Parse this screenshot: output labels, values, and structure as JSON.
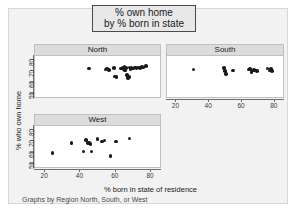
{
  "title": {
    "line1": "% own home",
    "line2": "by % born in state"
  },
  "axis": {
    "ylabel": "% who own home",
    "xlabel": "% born in state of residence",
    "note": "Graphs by Region North, South, or West",
    "yticks": [
      "80",
      "70",
      "60",
      "50"
    ],
    "xticks": [
      "20",
      "40",
      "60",
      "80"
    ]
  },
  "panels": {
    "north_label": "North",
    "south_label": "South",
    "west_label": "West"
  },
  "colors": {
    "marker": "#1a1a1a",
    "panel_header": "#dcdcdc",
    "plot_background": "#ffffff",
    "graph_background": "#f2f2f2",
    "title_box_background": "#e8e8e8",
    "axis": "#6e6e6e"
  },
  "chart_data": {
    "type": "scatter",
    "title": "% own home by % born in state",
    "xlabel": "% born in state of residence",
    "ylabel": "% who own home",
    "note": "Graphs by Region North, South, or West",
    "xlim": [
      14,
      86
    ],
    "ylim": [
      46,
      84
    ],
    "xticks": [
      20,
      40,
      60,
      80
    ],
    "yticks": [
      50,
      60,
      70,
      80
    ],
    "grid": false,
    "legend": "none",
    "facet_by": "Region",
    "series": [
      {
        "name": "North",
        "points": [
          [
            45.0,
            72.5
          ],
          [
            54.5,
            71.5
          ],
          [
            55.5,
            72.5
          ],
          [
            56.5,
            71.0
          ],
          [
            59.5,
            73.0
          ],
          [
            60.0,
            65.0
          ],
          [
            61.0,
            64.5
          ],
          [
            63.5,
            72.5
          ],
          [
            64.5,
            73.5
          ],
          [
            65.0,
            72.0
          ],
          [
            65.5,
            74.0
          ],
          [
            66.0,
            70.5
          ],
          [
            66.5,
            73.0
          ],
          [
            67.0,
            66.5
          ],
          [
            67.5,
            63.5
          ],
          [
            68.0,
            64.5
          ],
          [
            68.5,
            73.5
          ],
          [
            69.0,
            72.0
          ],
          [
            69.5,
            73.0
          ],
          [
            70.5,
            72.5
          ],
          [
            71.5,
            73.5
          ],
          [
            72.5,
            73.0
          ],
          [
            73.5,
            73.5
          ],
          [
            74.5,
            73.0
          ],
          [
            75.5,
            74.0
          ],
          [
            76.5,
            73.5
          ],
          [
            78.0,
            74.5
          ]
        ]
      },
      {
        "name": "South",
        "points": [
          [
            30.5,
            71.5
          ],
          [
            49.5,
            73.0
          ],
          [
            50.0,
            70.0
          ],
          [
            50.5,
            67.5
          ],
          [
            55.0,
            70.5
          ],
          [
            64.5,
            71.5
          ],
          [
            65.5,
            72.0
          ],
          [
            66.5,
            69.0
          ],
          [
            67.0,
            70.5
          ],
          [
            68.0,
            71.0
          ],
          [
            69.0,
            70.5
          ],
          [
            70.0,
            70.0
          ],
          [
            76.5,
            72.5
          ],
          [
            77.5,
            70.5
          ],
          [
            78.5,
            72.0
          ],
          [
            79.0,
            70.0
          ]
        ]
      },
      {
        "name": "West",
        "points": [
          [
            24.0,
            59.0
          ],
          [
            35.0,
            68.0
          ],
          [
            42.0,
            60.5
          ],
          [
            43.5,
            71.0
          ],
          [
            44.5,
            68.5
          ],
          [
            45.5,
            68.0
          ],
          [
            46.0,
            67.5
          ],
          [
            46.5,
            60.5
          ],
          [
            50.0,
            72.0
          ],
          [
            52.5,
            69.5
          ],
          [
            54.0,
            70.5
          ],
          [
            57.5,
            56.0
          ],
          [
            60.5,
            69.5
          ],
          [
            68.5,
            72.5
          ]
        ]
      }
    ]
  }
}
